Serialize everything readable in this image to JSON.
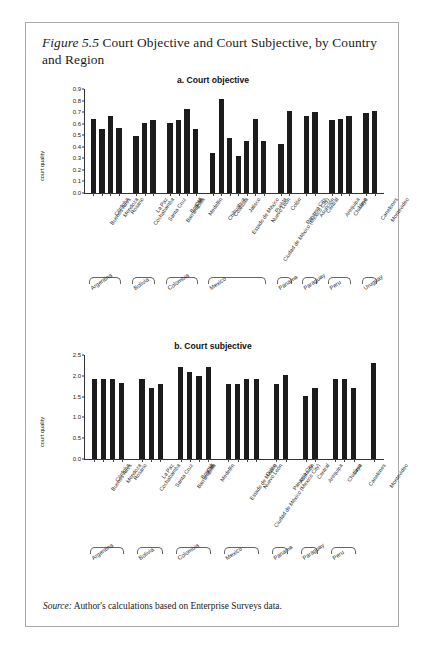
{
  "figure": {
    "number_label": "Figure 5.5",
    "title": "Court Objective and Court Subjective, by Country and Region",
    "source_label": "Source:",
    "source_text": "Author's calculations based on Enterprise Surveys data."
  },
  "chart_data": [
    {
      "type": "bar",
      "panel": "a",
      "title": "a. Court objective",
      "xlabel": "",
      "ylabel": "court quality",
      "ylim": [
        0.0,
        0.9
      ],
      "yticks": [
        "0.0",
        "0.1",
        "0.2",
        "0.3",
        "0.4",
        "0.5",
        "0.6",
        "0.7",
        "0.8",
        "0.9"
      ],
      "grid": false,
      "legend": "none",
      "categories": [
        "Buenos Aires",
        "Córdoba",
        "Mendoza",
        "Rosario",
        "Cochabamba",
        "La Paz",
        "Santa Cruz",
        "Barranquilla",
        "Bogotá",
        "Cali",
        "Medellín",
        "Chihuahua",
        "Coahuila",
        "Estado de México",
        "Jalisco",
        "Ciudad de México (Mexico City)",
        "Nuevo León",
        "Puebla",
        "Colón",
        "Panama City",
        "Asunción",
        "Central",
        "Arequipa",
        "Chiclayo",
        "Lima",
        "Canelones",
        "Montevideo"
      ],
      "values": [
        0.64,
        0.55,
        0.67,
        0.56,
        0.49,
        0.61,
        0.63,
        0.61,
        0.63,
        0.73,
        0.55,
        0.35,
        0.81,
        0.48,
        0.32,
        0.45,
        0.64,
        0.45,
        0.42,
        0.71,
        0.67,
        0.7,
        0.63,
        0.64,
        0.67,
        0.69,
        0.71
      ],
      "groups": [
        {
          "name": "Argentina",
          "count": 4
        },
        {
          "name": "Bolivia",
          "count": 3
        },
        {
          "name": "Colombia",
          "count": 4
        },
        {
          "name": "Mexico",
          "count": 7
        },
        {
          "name": "Panama",
          "count": 2
        },
        {
          "name": "Paraguay",
          "count": 2
        },
        {
          "name": "Peru",
          "count": 3
        },
        {
          "name": "Uruguay",
          "count": 2
        }
      ]
    },
    {
      "type": "bar",
      "panel": "b",
      "title": "b. Court subjective",
      "xlabel": "",
      "ylabel": "court quality",
      "ylim": [
        0.0,
        2.5
      ],
      "yticks": [
        "0.0",
        "0.5",
        "1.0",
        "1.5",
        "2.0",
        "2.5"
      ],
      "grid": false,
      "legend": "none",
      "categories": [
        "Buenos Aires",
        "Córdoba",
        "Mendoza",
        "Rosario",
        "Cochabamba",
        "La Paz",
        "Santa Cruz",
        "Barranquilla",
        "Bogotá",
        "Cali",
        "Medellín",
        "Estado de México",
        "Ciudad de México (Mexico City)",
        "Nuevo León",
        "Colón",
        "Panama City",
        "Asunción",
        "Central",
        "Arequipa",
        "Chiclayo",
        "Lima",
        "Canelones",
        "Montevideo"
      ],
      "values": [
        1.92,
        1.92,
        1.92,
        1.82,
        1.92,
        1.7,
        1.8,
        2.2,
        2.1,
        2.0,
        2.2,
        1.8,
        1.8,
        1.92,
        1.92,
        1.8,
        2.02,
        1.52,
        1.7,
        1.92,
        1.92,
        1.7,
        2.3
      ],
      "groups": [
        {
          "name": "Argentina",
          "count": 4
        },
        {
          "name": "Bolivia",
          "count": 3
        },
        {
          "name": "Colombia",
          "count": 4
        },
        {
          "name": "Mexico",
          "count": 4
        },
        {
          "name": "Panama",
          "count": 2
        },
        {
          "name": "Paraguay",
          "count": 2
        },
        {
          "name": "Peru",
          "count": 3
        },
        {
          "name": "Uruguay",
          "count": 2
        }
      ]
    }
  ]
}
